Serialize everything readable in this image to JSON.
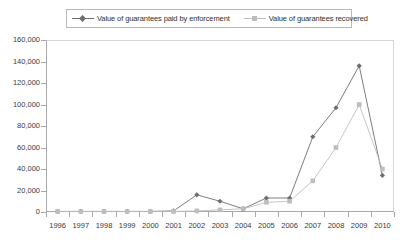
{
  "chart_data": {
    "type": "line",
    "title": "",
    "xlabel": "",
    "ylabel": "",
    "categories": [
      "1996",
      "1997",
      "1998",
      "1999",
      "2000",
      "2001",
      "2002",
      "2003",
      "2004",
      "2005",
      "2006",
      "2007",
      "2008",
      "2009",
      "2010"
    ],
    "ylim": [
      0,
      160000
    ],
    "yticks": [
      0,
      20000,
      40000,
      60000,
      80000,
      100000,
      120000,
      140000,
      160000
    ],
    "ytick_labels": [
      "0",
      "20,000",
      "40,000",
      "60,000",
      "80,000",
      "100,000",
      "120,000",
      "140,000",
      "160,000"
    ],
    "grid": false,
    "legend_position": "top",
    "series": [
      {
        "name": "Value of guarantees paid by enforcement",
        "color": "#6e6e6e",
        "marker": "diamond",
        "values": [
          500,
          500,
          500,
          500,
          500,
          1000,
          16000,
          10000,
          3000,
          13000,
          13000,
          70000,
          97000,
          136000,
          34000
        ]
      },
      {
        "name": "Value of guarantees recovered",
        "color": "#bdbdbd",
        "marker": "square",
        "values": [
          500,
          500,
          500,
          500,
          500,
          500,
          1000,
          2000,
          3000,
          9000,
          10000,
          29000,
          60000,
          100000,
          40000
        ]
      }
    ]
  },
  "legend": {
    "entries": [
      {
        "label": "Value of guarantees paid by enforcement"
      },
      {
        "label": "Value of guarantees recovered"
      }
    ]
  },
  "colors": {
    "series_paid": "#6e6e6e",
    "series_recovered": "#bdbdbd",
    "axis": "#a8a8a8",
    "frame": "#d6d6d6",
    "text": "#3a3a3a",
    "background": "#ffffff"
  }
}
